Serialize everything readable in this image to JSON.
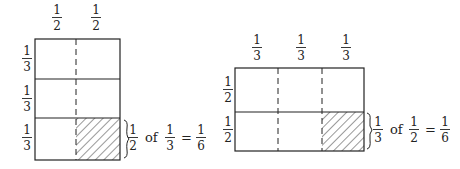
{
  "colors": {
    "ink": "#222222",
    "background": "#ffffff"
  },
  "left_diagram": {
    "column_labels": [
      {
        "num": "1",
        "den": "2"
      },
      {
        "num": "1",
        "den": "2"
      }
    ],
    "row_labels": [
      {
        "num": "1",
        "den": "3"
      },
      {
        "num": "1",
        "den": "3"
      },
      {
        "num": "1",
        "den": "3"
      }
    ],
    "shaded_cell": {
      "row": 3,
      "col": 2
    },
    "equation": {
      "a": {
        "num": "1",
        "den": "2"
      },
      "of": "of",
      "b": {
        "num": "1",
        "den": "3"
      },
      "eq": "=",
      "result": {
        "num": "1",
        "den": "6"
      }
    }
  },
  "right_diagram": {
    "column_labels": [
      {
        "num": "1",
        "den": "3"
      },
      {
        "num": "1",
        "den": "3"
      },
      {
        "num": "1",
        "den": "3"
      }
    ],
    "row_labels": [
      {
        "num": "1",
        "den": "2"
      },
      {
        "num": "1",
        "den": "2"
      }
    ],
    "shaded_cell": {
      "row": 2,
      "col": 3
    },
    "equation": {
      "a": {
        "num": "1",
        "den": "3"
      },
      "of": "of",
      "b": {
        "num": "1",
        "den": "2"
      },
      "eq": "=",
      "result": {
        "num": "1",
        "den": "6"
      }
    }
  }
}
